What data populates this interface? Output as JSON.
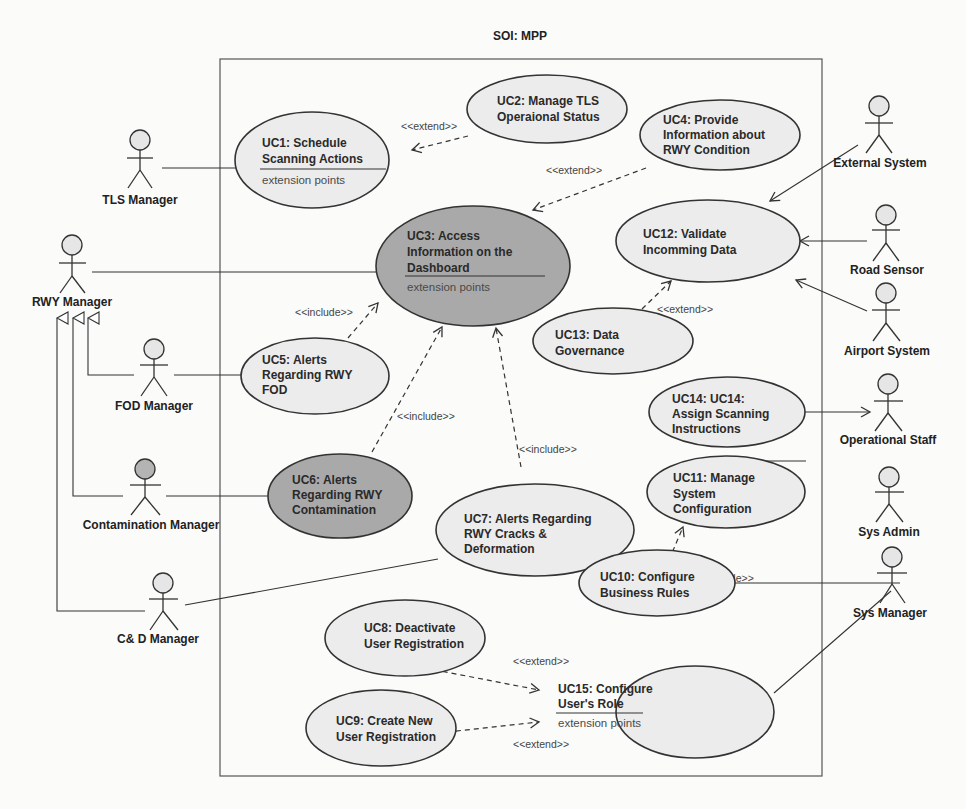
{
  "diagram": {
    "title": "SOI: MPP",
    "colors": {
      "usecase_fill": "#ececec",
      "usecase_highlight_fill": "#a9a9a9",
      "actor_head_fill": "#e6e6e6",
      "actor_head_highlight_fill": "#b4b4b4",
      "line": "#333333"
    },
    "actors": [
      {
        "id": "tls_manager",
        "label": "TLS Manager"
      },
      {
        "id": "rwy_manager",
        "label": "RWY Manager"
      },
      {
        "id": "fod_manager",
        "label": "FOD Manager"
      },
      {
        "id": "contamination_manager",
        "label": "Contamination Manager"
      },
      {
        "id": "cd_manager",
        "label": "C& D  Manager"
      },
      {
        "id": "external_system",
        "label": "External System"
      },
      {
        "id": "road_sensor",
        "label": "Road Sensor"
      },
      {
        "id": "airport_system",
        "label": "Airport System"
      },
      {
        "id": "operational_staff",
        "label": "Operational Staff"
      },
      {
        "id": "sys_admin",
        "label": "Sys Admin"
      },
      {
        "id": "sys_manager",
        "label": "Sys Manager"
      }
    ],
    "usecases": [
      {
        "id": "uc1",
        "lines": [
          "UC1: Schedule",
          "Scanning Actions"
        ],
        "ext": "extension points"
      },
      {
        "id": "uc2",
        "lines": [
          "UC2: Manage TLS",
          "Operaional Status"
        ]
      },
      {
        "id": "uc3",
        "lines": [
          "UC3: Access",
          "Information on the",
          "Dashboard"
        ],
        "ext": "extension points"
      },
      {
        "id": "uc4",
        "lines": [
          "UC4: Provide",
          "Information about",
          "RWY Condition"
        ]
      },
      {
        "id": "uc5",
        "lines": [
          "UC5: Alerts",
          "Regarding RWY",
          "FOD"
        ]
      },
      {
        "id": "uc6",
        "lines": [
          "UC6: Alerts",
          "Regarding RWY",
          "Contamination"
        ]
      },
      {
        "id": "uc7",
        "lines": [
          "UC7: Alerts Regarding",
          "RWY Cracks &",
          "Deformation"
        ]
      },
      {
        "id": "uc8",
        "lines": [
          "UC8: Deactivate",
          "User Registration"
        ]
      },
      {
        "id": "uc9",
        "lines": [
          "UC9: Create New",
          "User Registration"
        ]
      },
      {
        "id": "uc10",
        "lines": [
          "UC10: Configure",
          "Business Rules"
        ]
      },
      {
        "id": "uc11",
        "lines": [
          "UC11: Manage",
          "System",
          "Configuration"
        ]
      },
      {
        "id": "uc12",
        "lines": [
          "UC12: Validate",
          "Incomming Data"
        ]
      },
      {
        "id": "uc13",
        "lines": [
          "UC13: Data",
          "Governance"
        ]
      },
      {
        "id": "uc14",
        "lines": [
          "UC14: UC14:",
          "Assign Scanning",
          "Instructions"
        ]
      },
      {
        "id": "uc15",
        "lines": [
          "UC15: Configure",
          "User's Role"
        ],
        "ext": "extension points"
      }
    ],
    "stereotypes": {
      "extend": "<<extend>>",
      "include": "<<include>>"
    },
    "relations": [
      {
        "from": "uc2",
        "to": "uc1",
        "type": "extend"
      },
      {
        "from": "uc4",
        "to": "uc3",
        "type": "extend"
      },
      {
        "from": "uc13",
        "to": "uc12",
        "type": "extend"
      },
      {
        "from": "uc5",
        "to": "uc3",
        "type": "include"
      },
      {
        "from": "uc6",
        "to": "uc3",
        "type": "include"
      },
      {
        "from": "uc7",
        "to": "uc3",
        "type": "include"
      },
      {
        "from": "uc10",
        "to": "uc11",
        "type": "include"
      },
      {
        "from": "uc8",
        "to": "uc15",
        "type": "extend"
      },
      {
        "from": "uc9",
        "to": "uc15",
        "type": "extend"
      }
    ]
  }
}
